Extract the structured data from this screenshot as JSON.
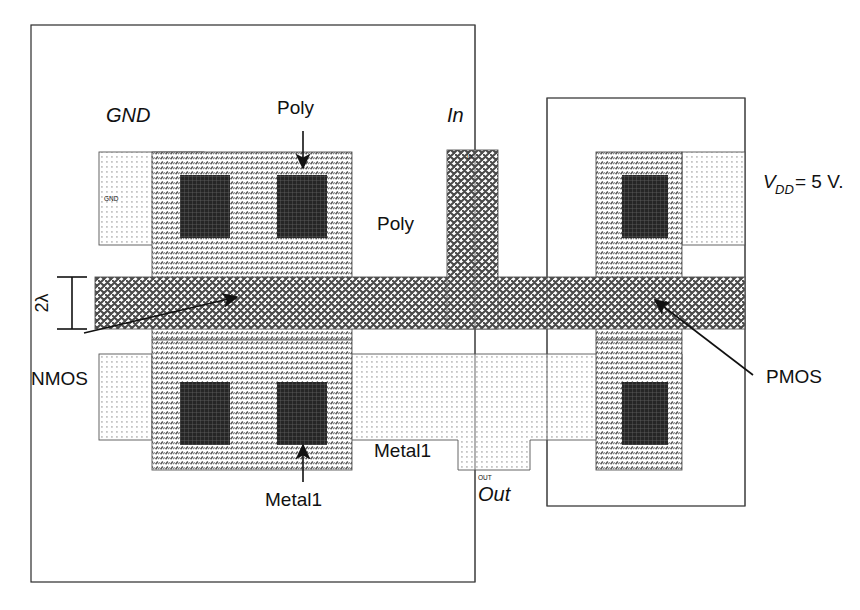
{
  "figure": {
    "kind": "cmos-inverter-layout",
    "background": "#ffffff"
  },
  "labels": {
    "gnd": "GND",
    "poly_top": "Poly",
    "poly_right": "Poly",
    "in": "In",
    "in_pin": "In",
    "gnd_pin": "GND",
    "out_pin": "OUT",
    "out": "Out",
    "vdd_v": "V",
    "vdd_sub": "DD",
    "vdd_rest": " = 5 V.",
    "nmos": "NMOS",
    "pmos": "PMOS",
    "metal1_mid": "Metal1",
    "metal1_bottom": "Metal1",
    "lambda": "2λ"
  },
  "colors": {
    "outline": "#2b2b2b",
    "hairline": "#555555",
    "leader": "#111111",
    "contact": "#2a2a2a",
    "poly_fill": "#b9b9b9",
    "diffusion_fill": "#d2d2d2",
    "metal1_fill": "#ececec",
    "text": "#111111"
  },
  "layer_legend": {
    "poly": "diagonal hatch",
    "diffusion": "dense dot / stipple",
    "metal1": "fine dot grid",
    "contact": "solid dark cross-hatch"
  }
}
